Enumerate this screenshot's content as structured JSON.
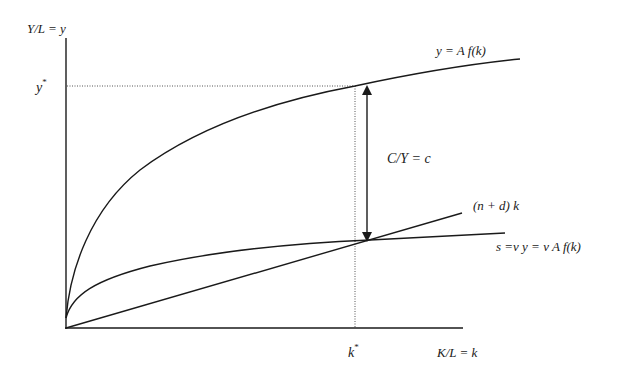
{
  "diagram": {
    "axes": {
      "y_label": "Y/L = y",
      "x_label": "K/L = k"
    },
    "markers": {
      "y_star": "y",
      "y_star_sup": "*",
      "k_star": "k",
      "k_star_sup": "*"
    },
    "curves": {
      "production": "y = A f(k)",
      "depreciation_line": "(n + d) k",
      "savings": "s =v y = v A f(k)"
    },
    "annotations": {
      "consumption_gap": "C/Y = c"
    },
    "colors": {
      "line": "#1a1a1a",
      "dotted": "#555555",
      "background": "#ffffff"
    }
  }
}
